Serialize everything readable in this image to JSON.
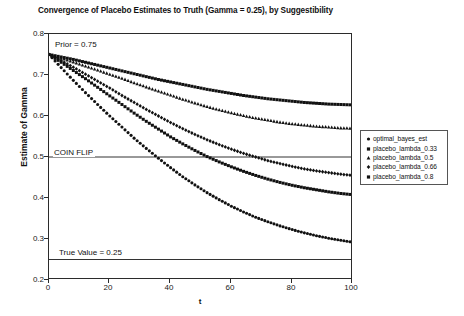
{
  "chart_data": {
    "type": "scatter",
    "title": "Convergence of Placebo Estimates to Truth (Gamma = 0.25), by Suggestibility",
    "xlabel": "t",
    "ylabel": "Estimate of Gamma",
    "xlim": [
      0,
      100
    ],
    "ylim": [
      0.2,
      0.8
    ],
    "grid": false,
    "legend_position": "right",
    "xticks": [
      "0",
      "20",
      "40",
      "60",
      "80",
      "100"
    ],
    "xtick_values": [
      0,
      20,
      40,
      60,
      80,
      100
    ],
    "yticks": [
      "0.2",
      "0.3",
      "0.4",
      "0.5",
      "0.6",
      "0.7",
      "0.8"
    ],
    "ytick_values": [
      0.2,
      0.3,
      0.4,
      0.5,
      0.6,
      0.7,
      0.8
    ],
    "annotations": [
      {
        "text": "Prior = 0.75",
        "x": 2,
        "y": 0.772
      },
      {
        "text": "COIN FLIP",
        "x": 2,
        "y": 0.5
      },
      {
        "text": "True Value = 0.25",
        "x": 2,
        "y": 0.272
      }
    ],
    "reference_lines": [
      {
        "label": "COIN FLIP",
        "y": 0.5
      },
      {
        "label": "True Value = 0.25",
        "y": 0.25
      }
    ],
    "series": [
      {
        "name": "optimal_bayes_est",
        "marker": "circle",
        "color": "#111111",
        "x": [
          0,
          4,
          8,
          12,
          16,
          20,
          24,
          28,
          32,
          36,
          40,
          44,
          48,
          52,
          56,
          60,
          64,
          68,
          72,
          76,
          80,
          84,
          88,
          92,
          96,
          100
        ],
        "y": [
          0.75,
          0.718,
          0.687,
          0.657,
          0.628,
          0.6,
          0.573,
          0.546,
          0.521,
          0.497,
          0.474,
          0.452,
          0.432,
          0.413,
          0.396,
          0.38,
          0.366,
          0.353,
          0.342,
          0.332,
          0.323,
          0.315,
          0.308,
          0.302,
          0.297,
          0.292
        ]
      },
      {
        "name": "placebo_lambda_0.33",
        "marker": "square",
        "color": "#111111",
        "x": [
          0,
          4,
          8,
          12,
          16,
          20,
          24,
          28,
          32,
          36,
          40,
          44,
          48,
          52,
          56,
          60,
          64,
          68,
          72,
          76,
          80,
          84,
          88,
          92,
          96,
          100
        ],
        "y": [
          0.75,
          0.744,
          0.738,
          0.731,
          0.724,
          0.717,
          0.71,
          0.703,
          0.696,
          0.689,
          0.683,
          0.677,
          0.671,
          0.665,
          0.66,
          0.655,
          0.65,
          0.646,
          0.642,
          0.639,
          0.636,
          0.633,
          0.631,
          0.629,
          0.628,
          0.627
        ]
      },
      {
        "name": "placebo_lambda_0.5",
        "marker": "triangle",
        "color": "#111111",
        "x": [
          0,
          4,
          8,
          12,
          16,
          20,
          24,
          28,
          32,
          36,
          40,
          44,
          48,
          52,
          56,
          60,
          64,
          68,
          72,
          76,
          80,
          84,
          88,
          92,
          96,
          100
        ],
        "y": [
          0.75,
          0.741,
          0.732,
          0.722,
          0.712,
          0.702,
          0.692,
          0.681,
          0.671,
          0.661,
          0.651,
          0.641,
          0.632,
          0.623,
          0.615,
          0.608,
          0.601,
          0.595,
          0.59,
          0.585,
          0.581,
          0.578,
          0.575,
          0.573,
          0.571,
          0.57
        ]
      },
      {
        "name": "placebo_lambda_0.66",
        "marker": "diamond",
        "color": "#111111",
        "x": [
          0,
          4,
          8,
          12,
          16,
          20,
          24,
          28,
          32,
          36,
          40,
          44,
          48,
          52,
          56,
          60,
          64,
          68,
          72,
          76,
          80,
          84,
          88,
          92,
          96,
          100
        ],
        "y": [
          0.75,
          0.735,
          0.719,
          0.702,
          0.685,
          0.668,
          0.65,
          0.633,
          0.616,
          0.6,
          0.584,
          0.569,
          0.555,
          0.542,
          0.53,
          0.519,
          0.509,
          0.5,
          0.491,
          0.484,
          0.477,
          0.471,
          0.466,
          0.462,
          0.458,
          0.455
        ]
      },
      {
        "name": "placebo_lambda_0.8",
        "marker": "square",
        "color": "#111111",
        "x": [
          0,
          4,
          8,
          12,
          16,
          20,
          24,
          28,
          32,
          36,
          40,
          44,
          48,
          52,
          56,
          60,
          64,
          68,
          72,
          76,
          80,
          84,
          88,
          92,
          96,
          100
        ],
        "y": [
          0.75,
          0.731,
          0.711,
          0.691,
          0.67,
          0.649,
          0.628,
          0.607,
          0.587,
          0.568,
          0.549,
          0.532,
          0.516,
          0.501,
          0.488,
          0.476,
          0.465,
          0.455,
          0.446,
          0.438,
          0.431,
          0.425,
          0.42,
          0.415,
          0.411,
          0.408
        ]
      }
    ],
    "legend_entries": [
      {
        "label": "optimal_bayes_est",
        "marker": "circle"
      },
      {
        "label": "placebo_lambda_0.33",
        "marker": "square"
      },
      {
        "label": "placebo_lambda_0.5",
        "marker": "triangle"
      },
      {
        "label": "placebo_lambda_0.66",
        "marker": "diamond"
      },
      {
        "label": "placebo_lambda_0.8",
        "marker": "square"
      }
    ]
  }
}
